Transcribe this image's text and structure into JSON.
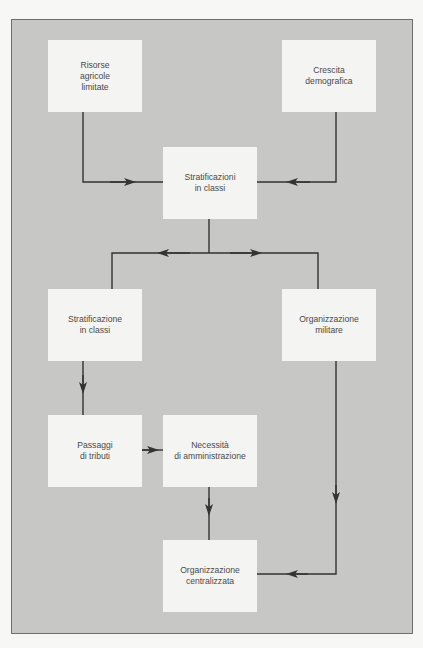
{
  "diagram": {
    "type": "flowchart",
    "colors": {
      "page_background": "#f7f7f5",
      "panel_background": "#c7c7c5",
      "panel_border": "#6e6e6e",
      "node_fill": "#f4f4f2",
      "text": "#4a4a4a",
      "edge": "#333333"
    },
    "nodes": [
      {
        "id": "risorse",
        "lines": [
          "Risorse",
          "agricole",
          "limitate"
        ]
      },
      {
        "id": "crescita",
        "lines": [
          "Crescita",
          "demografica"
        ]
      },
      {
        "id": "stratificazioni",
        "lines": [
          "Stratificazioni",
          "in classi"
        ]
      },
      {
        "id": "stratificazione",
        "lines": [
          "Stratificazione",
          "in classi"
        ]
      },
      {
        "id": "militare",
        "lines": [
          "Organizzazione",
          "militare"
        ]
      },
      {
        "id": "passaggi",
        "lines": [
          "Passaggi",
          "di tributi"
        ]
      },
      {
        "id": "necessita",
        "lines": [
          "Necessità",
          "di amministrazione"
        ]
      },
      {
        "id": "centralizzata",
        "lines": [
          "Organizzazione",
          "centralizzata"
        ]
      }
    ],
    "edges": [
      {
        "from": "risorse",
        "to": "stratificazioni"
      },
      {
        "from": "crescita",
        "to": "stratificazioni"
      },
      {
        "from": "stratificazioni",
        "to": "stratificazione"
      },
      {
        "from": "stratificazioni",
        "to": "militare"
      },
      {
        "from": "stratificazione",
        "to": "passaggi"
      },
      {
        "from": "passaggi",
        "to": "necessita"
      },
      {
        "from": "necessita",
        "to": "centralizzata"
      },
      {
        "from": "militare",
        "to": "centralizzata"
      }
    ]
  }
}
